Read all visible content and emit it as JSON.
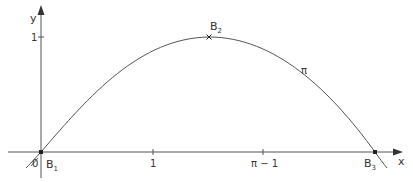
{
  "figure": {
    "axes": {
      "x_label": "x",
      "y_label": "y",
      "origin_label": "0",
      "x_ticks": [
        {
          "label": "1",
          "x": 153
        },
        {
          "label": "π − 1",
          "x": 263
        }
      ],
      "y_ticks": [
        {
          "label": "1",
          "y": 37
        }
      ]
    },
    "curve": {
      "label": "π",
      "description": "sine-like arch through B1, B2, B3"
    },
    "points": [
      {
        "name": "B",
        "sub": "1",
        "x": 41,
        "y": 152
      },
      {
        "name": "B",
        "sub": "2",
        "x": 209,
        "y": 37
      },
      {
        "name": "B",
        "sub": "3",
        "x": 375,
        "y": 152
      }
    ],
    "colors": {
      "axis": "#555555",
      "curve": "#555555",
      "text": "#333333"
    }
  }
}
